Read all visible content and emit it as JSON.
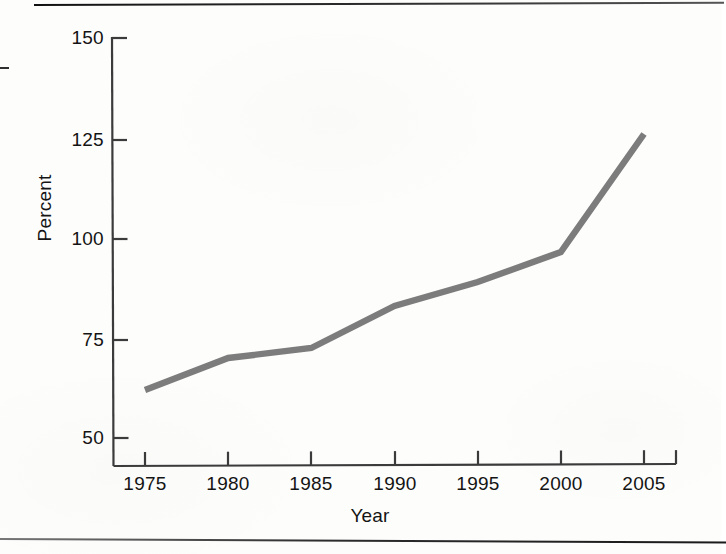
{
  "chart_data": {
    "type": "line",
    "title": "",
    "xlabel": "Year",
    "ylabel": "Percent",
    "x": [
      1975,
      1980,
      1985,
      1990,
      1995,
      2000,
      2005
    ],
    "values": [
      62,
      70,
      72.5,
      83,
      89,
      96.5,
      126
    ],
    "series": [
      {
        "name": "Percent",
        "values": [
          62,
          70,
          72.5,
          83,
          89,
          96.5,
          126
        ]
      }
    ],
    "xlim": [
      1975,
      2005
    ],
    "ylim": [
      50,
      150
    ],
    "x_ticks": [
      "1975",
      "1980",
      "1985",
      "1990",
      "1995",
      "2000",
      "2005"
    ],
    "y_ticks": [
      "50",
      "75",
      "100",
      "125",
      "150"
    ],
    "grid": false,
    "legend": "none",
    "line_color": "#7c7c7c",
    "axis_color": "#3b3b3b"
  },
  "axes": {
    "y_title": "Percent",
    "x_title": "Year",
    "y_ticks": [
      {
        "label": "150",
        "value": 150
      },
      {
        "label": "125",
        "value": 125
      },
      {
        "label": "100",
        "value": 100
      },
      {
        "label": "75",
        "value": 75
      },
      {
        "label": "50",
        "value": 50
      }
    ],
    "x_ticks": [
      {
        "label": "1975",
        "value": 1975
      },
      {
        "label": "1980",
        "value": 1980
      },
      {
        "label": "1985",
        "value": 1985
      },
      {
        "label": "1990",
        "value": 1990
      },
      {
        "label": "1995",
        "value": 1995
      },
      {
        "label": "2000",
        "value": 2000
      },
      {
        "label": "2005",
        "value": 2005
      }
    ]
  }
}
